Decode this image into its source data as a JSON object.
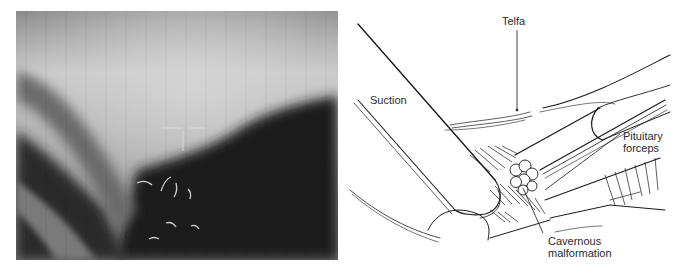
{
  "figure": {
    "panels": [
      {
        "id": "photo",
        "kind": "intraoperative-photograph",
        "description": "Grayscale endoscopic/microscopic view with crosshair overlay"
      },
      {
        "id": "illustration",
        "kind": "line-drawing",
        "labels": {
          "telfa": "Telfa",
          "suction": "Suction",
          "pituitary_forceps_line1": "Pituitary",
          "pituitary_forceps_line2": "forceps",
          "cavernous_malformation_line1": "Cavernous",
          "cavernous_malformation_line2": "malformation"
        }
      }
    ]
  },
  "colors": {
    "background": "#ffffff",
    "ink": "#1a1a1a",
    "label_text": "#2b2b2b",
    "photo_light": "#c9c9c9",
    "photo_dark": "#141414"
  }
}
